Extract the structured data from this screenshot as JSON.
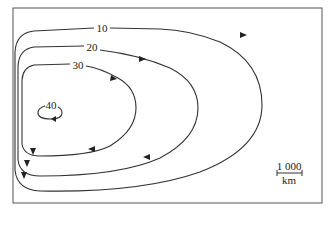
{
  "figure": {
    "contours": [
      {
        "label": "10"
      },
      {
        "label": "20"
      },
      {
        "label": "30"
      },
      {
        "label": "40"
      }
    ],
    "scale_bar": {
      "value": "1 000",
      "unit": "km"
    },
    "colors": {
      "line": "#333333",
      "frame": "#555555",
      "background": "#ffffff"
    }
  }
}
